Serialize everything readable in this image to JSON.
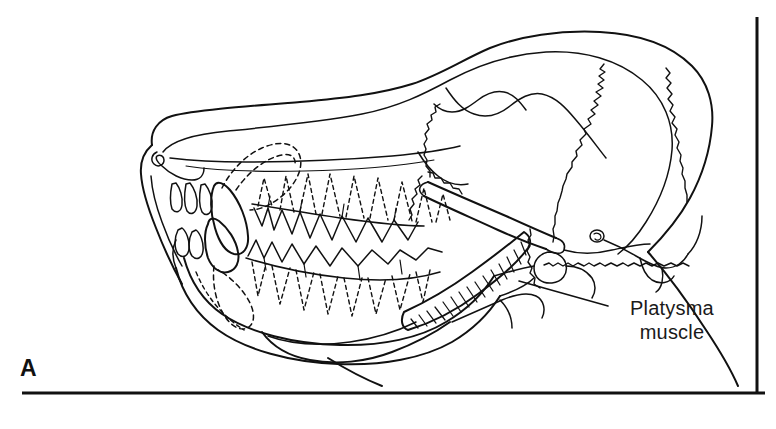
{
  "figure": {
    "panel_letter": "A",
    "background_color": "#ffffff",
    "ink_color": "#111111"
  },
  "labels": [
    {
      "id": "platysma",
      "line1": "Platysma",
      "line2": "muscle",
      "leader_from": [
        519,
        281
      ],
      "leader_to": [
        608,
        306
      ]
    }
  ],
  "frame": {
    "right_edge_present": true,
    "bottom_rule_present": true,
    "top_edge_present": false,
    "left_edge_present": false
  },
  "structures": {
    "outer_head_contour": "skin outline of muzzle, forehead and cranium",
    "skull_outline": "inner bony contour of cranium and rostrum",
    "maxillary_teeth": "upper tooth row, solid crowns with dashed roots",
    "mandibular_teeth": "lower tooth row, solid crowns with dashed roots",
    "zygomatic_arch": "diagonal bar crossing the temporal region",
    "mandible": "lower jaw ramus and body",
    "temporomandibular_joint": "condyle at caudal end of mandible",
    "cranial_sutures": "wavy suture lines across the braincase",
    "platysma_muscle": "hatched crescent-shaped muscle along ventral mandible",
    "neck_contour": "throat and nape contour lines",
    "external_auditory_meatus": "small oval opening caudal to the arch"
  }
}
